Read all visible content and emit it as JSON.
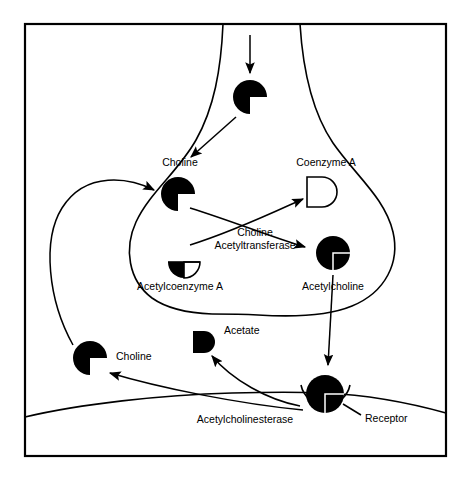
{
  "figure": {
    "background_color": "#ffffff",
    "line_color": "#000000",
    "frame": {
      "x": 25,
      "y": 24,
      "width": 421,
      "height": 432
    }
  },
  "labels": {
    "choline_presynaptic": "Choline",
    "coenzyme_a": "Coenzyme A",
    "enzyme_line1": "Choline",
    "enzyme_line2": "Acetyltransferase",
    "acetylcoenzyme_a": "Acetylcoenzyme A",
    "acetylcholine": "Acetylcholine",
    "acetate": "Acetate",
    "choline_cleft": "Choline",
    "acetylcholinesterase": "Acetylcholinesterase",
    "receptor": "Receptor"
  },
  "molecules": [
    {
      "id": "choline-axon",
      "name": "choline-axon-shape",
      "shape": "pacman-notch-lower-right",
      "fill": "#000000",
      "cx": 250,
      "cy": 97,
      "r": 17
    },
    {
      "id": "choline-terminal",
      "name": "choline-terminal-shape",
      "shape": "pacman-notch-lower-right",
      "fill": "#000000",
      "cx": 178,
      "cy": 194,
      "r": 17
    },
    {
      "id": "coenzyme-a",
      "name": "coenzyme-a-shape",
      "shape": "quarter-wedge-open",
      "fill": "#ffffff",
      "cx": 322,
      "cy": 192,
      "r": 15
    },
    {
      "id": "acetylcoenzyme-a",
      "name": "acetylcoenzyme-a-shape",
      "shape": "half-disc-split",
      "fill_left": "#000000",
      "fill_right": "#ffffff",
      "cx": 184,
      "cy": 262,
      "r": 16
    },
    {
      "id": "acetylcholine",
      "name": "acetylcholine-shape",
      "shape": "full-disc-with-notch-outline",
      "fill": "#000000",
      "cx": 333,
      "cy": 253,
      "r": 17
    },
    {
      "id": "acetate",
      "name": "acetate-shape",
      "shape": "quarter-wedge-filled",
      "fill": "#000000",
      "cx": 204,
      "cy": 342,
      "r": 12
    },
    {
      "id": "choline-cleft",
      "name": "choline-cleft-shape",
      "shape": "pacman-notch-lower-right",
      "fill": "#000000",
      "cx": 90,
      "cy": 358,
      "r": 17
    },
    {
      "id": "acetylcholine-bound",
      "name": "acetylcholine-bound-shape",
      "shape": "full-disc-with-notch-outline",
      "fill": "#000000",
      "cx": 325,
      "cy": 394,
      "r": 19
    }
  ],
  "arrows": [
    {
      "name": "arrow-choline-uptake-into-axon",
      "from": "top-of-figure",
      "to": "choline-axon"
    },
    {
      "name": "arrow-choline-axon-to-terminal",
      "from": "choline-axon",
      "to": "choline-terminal"
    },
    {
      "name": "arrow-choline-to-acetylcholine",
      "from": "choline-terminal",
      "to": "acetylcholine"
    },
    {
      "name": "arrow-acetylcoa-to-coenzyme-a",
      "from": "acetylcoenzyme-a",
      "to": "coenzyme-a"
    },
    {
      "name": "arrow-acetylcholine-release",
      "from": "acetylcholine",
      "to": "acetylcholine-bound"
    },
    {
      "name": "arrow-hydrolysis-to-acetate",
      "from": "acetylcholine-bound",
      "to": "acetate"
    },
    {
      "name": "arrow-hydrolysis-to-choline",
      "from": "acetylcholine-bound",
      "to": "choline-cleft"
    },
    {
      "name": "arrow-choline-reuptake",
      "from": "choline-cleft",
      "to": "choline-terminal"
    }
  ],
  "structures": [
    {
      "name": "presynaptic-terminal-outline",
      "description": "bulb-shaped nerve terminal"
    },
    {
      "name": "postsynaptic-membrane",
      "description": "curved membrane across lower figure"
    },
    {
      "name": "receptor-cup",
      "description": "semicircular receptor binding site"
    },
    {
      "name": "outer-frame",
      "description": "rectangular border around figure"
    }
  ]
}
